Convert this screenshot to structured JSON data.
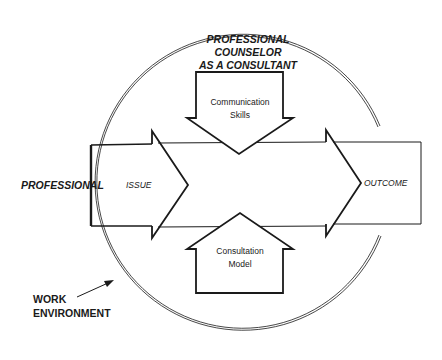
{
  "diagram": {
    "title_lines": [
      "PROFESSIONAL",
      "COUNSELOR",
      "AS A CONSULTANT"
    ],
    "down_arrow_label": [
      "Communication",
      "Skills"
    ],
    "up_arrow_label": [
      "Consultation",
      "Model"
    ],
    "left_label": "PROFESSIONAL",
    "issue_label": "ISSUE",
    "outcome_label": "OUTCOME",
    "environment_label": [
      "WORK",
      "ENVIRONMENT"
    ],
    "colors": {
      "stroke": "#1a1a1a",
      "background": "#ffffff"
    }
  }
}
